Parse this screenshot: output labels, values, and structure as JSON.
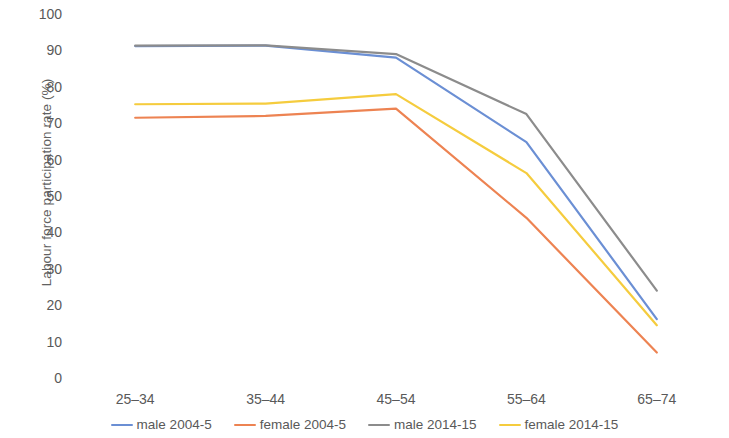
{
  "chart_data": {
    "type": "line",
    "title": "",
    "xlabel": "",
    "ylabel": "Labour force participation rate (%)",
    "categories": [
      "25–34",
      "35–44",
      "45–54",
      "55–64",
      "65–74"
    ],
    "ylim": [
      0,
      100
    ],
    "ytick_step": 10,
    "yticks": [
      "100",
      "90",
      "80",
      "70",
      "60",
      "50",
      "40",
      "30",
      "20",
      "10",
      "0"
    ],
    "grid": false,
    "legend_position": "bottom",
    "series": [
      {
        "name": "male 2004-5",
        "color": "#6b8fd4",
        "values": [
          91.2,
          91.3,
          88.0,
          64.8,
          16.2
        ]
      },
      {
        "name": "female 2004-5",
        "color": "#ed8352",
        "values": [
          71.5,
          72.0,
          74.0,
          44.0,
          7.0
        ]
      },
      {
        "name": "male 2014-15",
        "color": "#8c8c8c",
        "values": [
          91.3,
          91.4,
          89.0,
          72.5,
          24.0
        ]
      },
      {
        "name": "female 2014-15",
        "color": "#f5cc3e",
        "values": [
          75.2,
          75.4,
          78.0,
          56.3,
          14.5
        ]
      }
    ]
  },
  "axis": {
    "y_title": "Labour force participation rate (%)"
  },
  "legend": {
    "items": [
      {
        "label": "male 2004-5",
        "color": "#6b8fd4"
      },
      {
        "label": "female 2004-5",
        "color": "#ed8352"
      },
      {
        "label": "male 2014-15",
        "color": "#8c8c8c"
      },
      {
        "label": "female 2014-15",
        "color": "#f5cc3e"
      }
    ]
  }
}
